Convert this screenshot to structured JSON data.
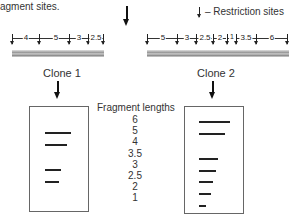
{
  "header": {
    "partial_caption": "agment sites.",
    "legend_label": "– Restriction sites"
  },
  "clone1": {
    "label": "Clone 1",
    "fragments": [
      "4",
      "5",
      "3",
      "2.5"
    ],
    "gel_bands": [
      "5",
      "4",
      "3",
      "2.5"
    ]
  },
  "clone2": {
    "label": "Clone 2",
    "fragments": [
      "5",
      "3",
      "2.5",
      "2",
      "1",
      "3.5",
      "6"
    ],
    "gel_bands": [
      "6",
      "5",
      "3.5",
      "3",
      "2.5",
      "2",
      "1"
    ]
  },
  "ladder": {
    "title": "Fragment lengths",
    "values": [
      "6",
      "5",
      "4",
      "3.5",
      "3",
      "2.5",
      "2",
      "1"
    ]
  },
  "colors": {
    "line": "#222222",
    "gel_border": "#666666",
    "dna_bar": "#a0a0a0"
  }
}
